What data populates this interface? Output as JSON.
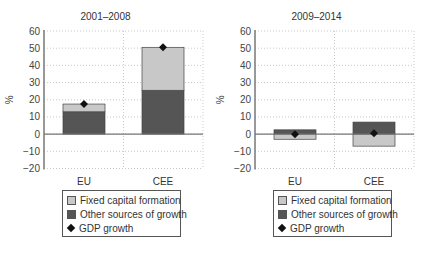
{
  "chart_data": [
    {
      "type": "bar",
      "stacked": true,
      "title": "2001–2008",
      "ylabel": "%",
      "ylim": [
        -20,
        60
      ],
      "yticks": [
        60,
        50,
        40,
        30,
        20,
        10,
        0,
        -10,
        -20
      ],
      "categories": [
        "EU",
        "CEE"
      ],
      "series": [
        {
          "name": "Other sources of growth",
          "values": [
            13,
            25.5
          ]
        },
        {
          "name": "Fixed capital formation",
          "values": [
            4.5,
            25
          ]
        },
        {
          "name": "GDP growth",
          "kind": "marker",
          "values": [
            17.5,
            50.5
          ]
        }
      ],
      "grid": true
    },
    {
      "type": "bar",
      "stacked": true,
      "title": "2009–2014",
      "ylabel": "%",
      "ylim": [
        -20,
        60
      ],
      "yticks": [
        60,
        50,
        40,
        30,
        20,
        10,
        0,
        -10,
        -20
      ],
      "categories": [
        "EU",
        "CEE"
      ],
      "series": [
        {
          "name": "Other sources of growth",
          "values": [
            2.5,
            7
          ]
        },
        {
          "name": "Fixed capital formation",
          "values": [
            -3,
            -7
          ]
        },
        {
          "name": "GDP growth",
          "kind": "marker",
          "values": [
            0,
            0.5
          ]
        }
      ],
      "grid": true
    }
  ],
  "legend": {
    "items": [
      {
        "label": "Fixed capital formation",
        "color": "#c8c8c8"
      },
      {
        "label": "Other sources of growth",
        "color": "#555555"
      },
      {
        "label": "GDP growth",
        "color": "#111111"
      }
    ]
  },
  "colors": {
    "fixed": "#c8c8c8",
    "other": "#555555",
    "gdp": "#111111",
    "axis": "#777777",
    "grid": "#bbbbbb"
  }
}
